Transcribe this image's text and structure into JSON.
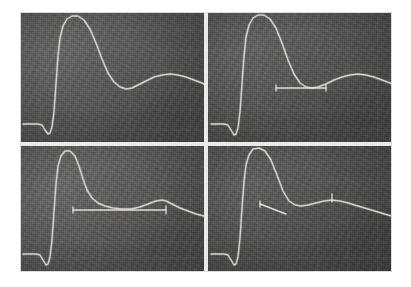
{
  "figure": {
    "layout": "2x2 grid of photographed oscilloscope traces",
    "background_color": "#ffffff",
    "mount_color": "#e9e9e7",
    "divider_color": "#eceae6",
    "panel_background_color": "#555452",
    "trace_color": "#ded9cf",
    "cursor_color": "#e7e3da",
    "grid_color": "#8d8d88"
  },
  "panels": [
    {
      "id": "panel-top-left",
      "position": "top-left",
      "label": "A",
      "has_cursor": false,
      "cursor_type": "none",
      "grid_h": [
        18,
        38,
        58,
        78,
        98,
        118
      ],
      "grid_v": [
        20,
        50,
        80,
        110,
        140,
        170
      ],
      "trace_path": "M 3,112 L 18,112 L 22,113 L 25,118 L 28,122 L 30,121 L 32,115 L 34,100 L 36,72 L 38,44 L 40,26 L 43,14 L 47,7 L 52,4 L 58,4 L 64,8 L 70,17 L 76,31 L 82,47 L 88,61 L 94,70 L 100,75 L 106,77 L 112,76 L 118,73 L 126,69 L 134,65 L 142,63 L 150,62 L 158,63 L 166,65 L 174,68 L 182,71 L 184,72"
    },
    {
      "id": "panel-top-right",
      "position": "top-right",
      "label": "B",
      "has_cursor": true,
      "cursor_type": "horizontal-short",
      "cursor_x1": 68,
      "cursor_x2": 118,
      "cursor_y": 76,
      "grid_h": [
        18,
        38,
        58,
        78,
        98,
        118
      ],
      "grid_v": [
        20,
        50,
        80,
        110,
        140,
        170
      ],
      "trace_path": "M 3,112 L 16,112 L 20,113 L 23,118 L 26,123 L 28,122 L 30,116 L 32,100 L 34,72 L 36,44 L 38,25 L 41,13 L 45,6 L 50,3 L 56,3 L 62,7 L 68,16 L 74,31 L 80,48 L 86,62 L 92,71 L 98,75 L 104,76 L 110,75 L 118,72 L 126,68 L 134,65 L 142,63 L 150,62 L 158,63 L 166,65 L 174,68 L 182,71 L 184,72"
    },
    {
      "id": "panel-bottom-left",
      "position": "bottom-left",
      "label": "C",
      "has_cursor": true,
      "cursor_type": "horizontal-long",
      "cursor_x1": 53,
      "cursor_x2": 146,
      "cursor_y": 64,
      "grid_h": [
        16,
        36,
        56,
        76,
        96,
        112
      ],
      "grid_v": [
        20,
        50,
        80,
        110,
        140,
        170
      ],
      "trace_path": "M 3,108 L 16,108 L 20,109 L 23,114 L 26,119 L 28,118 L 30,111 L 32,94 L 34,66 L 36,38 L 38,20 L 41,10 L 45,5 L 50,5 L 55,10 L 59,20 L 63,33 L 67,44 L 72,52 L 78,57 L 85,60 L 93,62 L 102,63 L 111,63 L 120,61 L 128,58 L 136,55 L 142,54 L 146,55 L 152,58 L 160,62 L 168,65 L 176,68 L 184,70"
    },
    {
      "id": "panel-bottom-right",
      "position": "bottom-right",
      "label": "D",
      "has_cursor": true,
      "cursor_type": "diagonal-short",
      "cursor_x1": 52,
      "cursor_y1": 58,
      "cursor_x2": 78,
      "cursor_y2": 68,
      "grid_h": [
        16,
        36,
        56,
        76,
        96,
        112
      ],
      "grid_v": [
        20,
        50,
        80,
        110,
        140,
        170
      ],
      "trace_path": "M 3,108 L 16,108 L 20,109 L 23,114 L 26,119 L 28,118 L 30,111 L 32,92 L 34,62 L 36,36 L 38,19 L 41,9 L 45,3 L 51,2 L 57,5 L 63,14 L 69,29 L 75,45 L 81,55 L 87,59 L 93,60 L 100,59 L 108,57 L 116,55 L 124,54 L 132,55 L 140,57 L 150,60 L 160,63 L 170,66 L 180,69 L 184,70"
    }
  ]
}
